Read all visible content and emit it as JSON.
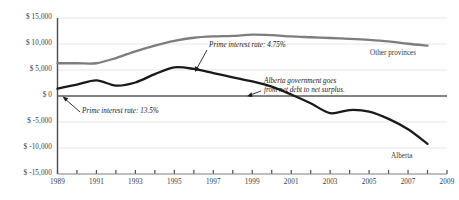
{
  "chart_data": {
    "type": "line",
    "title": "",
    "subtitle": "",
    "xlabel": "",
    "ylabel": "",
    "xlim": [
      1989,
      2009
    ],
    "ylim": [
      -15000,
      15000
    ],
    "grid": true,
    "legend_position": "inline-series-labels",
    "y_ticks": [
      15000,
      10000,
      5000,
      0,
      -5000,
      -10000,
      -15000
    ],
    "y_tick_labels": [
      "$ 15,000",
      "$ 10,000",
      "$ 5,000",
      "$ 0",
      "$ -5,000",
      "$ -10,000",
      "$ -15,000"
    ],
    "x_ticks": [
      1989,
      1990,
      1991,
      1992,
      1993,
      1994,
      1995,
      1996,
      1997,
      1998,
      1999,
      2000,
      2001,
      2002,
      2003,
      2004,
      2005,
      2006,
      2007,
      2008,
      2009
    ],
    "x_tick_labels": [
      "1989",
      "",
      "1991",
      "",
      "1993",
      "",
      "1995",
      "",
      "1997",
      "",
      "1999",
      "",
      "2001",
      "",
      "2003",
      "",
      "2005",
      "",
      "2007",
      "",
      "2009"
    ],
    "x": [
      1989,
      1990,
      1991,
      1992,
      1993,
      1994,
      1995,
      1996,
      1997,
      1998,
      1999,
      2000,
      2001,
      2002,
      2003,
      2004,
      2005,
      2006,
      2007,
      2008
    ],
    "series": [
      {
        "name": "Other provinces",
        "color": "#7d7d7d",
        "values": [
          6300,
          6300,
          6300,
          7300,
          8600,
          9700,
          10600,
          11200,
          11450,
          11550,
          11800,
          11700,
          11450,
          11300,
          11150,
          11000,
          10800,
          10500,
          10050,
          9700
        ]
      },
      {
        "name": "Alberta",
        "color": "#1a1a1a",
        "values": [
          1400,
          2200,
          3000,
          2000,
          2600,
          4200,
          5500,
          5200,
          4400,
          3600,
          2800,
          1800,
          300,
          -1400,
          -3300,
          -2700,
          -3000,
          -4400,
          -6400,
          -9200
        ]
      }
    ],
    "annotations": [
      {
        "id": "prime-rate-start",
        "text": "Prime interest rate: 13.5%",
        "points_to_year": 1989,
        "points_to_value": 1400
      },
      {
        "id": "prime-rate-mid",
        "text": "Prime interest rate: 4.75%",
        "points_to_year": 1998,
        "points_to_value": 3600
      },
      {
        "id": "net-debt-to-surplus",
        "text_line1": "Alberta government goes",
        "text_line2": "from net debt to net surplus.",
        "points_to_year": 2001,
        "points_to_value": 0
      }
    ]
  },
  "colors": {
    "background": "#ffffff",
    "axis": "#4d4d4d",
    "grid": "#e4e4e4",
    "zero_line": "#5a5a5a",
    "text": "#3a3a3a",
    "alberta": "#1a1a1a",
    "other_provinces": "#7d7d7d"
  }
}
